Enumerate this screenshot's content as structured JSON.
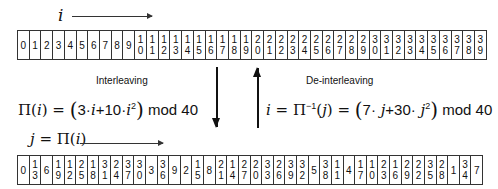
{
  "top": {
    "index_label": "i",
    "cells": [
      "0",
      "1",
      "2",
      "3",
      "4",
      "5",
      "6",
      "7",
      "8",
      "9",
      "10",
      "11",
      "12",
      "13",
      "14",
      "15",
      "16",
      "17",
      "18",
      "19",
      "20",
      "21",
      "22",
      "23",
      "24",
      "25",
      "26",
      "27",
      "28",
      "29",
      "30",
      "31",
      "32",
      "33",
      "34",
      "35",
      "36",
      "37",
      "38",
      "39"
    ]
  },
  "interleaving": {
    "label": "Interleaving",
    "formula_lhs": "Π(",
    "formula_var": "i",
    "formula_rest_open": ") = ",
    "term1_coef": "3·",
    "term1_var": "i",
    "plus": "+10·",
    "term2_var": "i",
    "term2_exp": "2",
    "mod": " mod 40"
  },
  "deinterleaving": {
    "label": "De-interleaving",
    "lhs_var": "i",
    "eq1": " = Π",
    "inv_exp": "−1",
    "open": "(",
    "arg": "j",
    "eq2": ") = ",
    "term1_coef": "7·",
    "term1_var": " j",
    "plus": "+30·",
    "term2_var": " j",
    "term2_exp": "2",
    "mod": " mod 40"
  },
  "bottom": {
    "index_label_var": "j",
    "index_label_eq": " = Π(",
    "index_label_arg": "i",
    "index_label_close": ")",
    "cells": [
      "0",
      "13",
      "6",
      "19",
      "12",
      "25",
      "18",
      "31",
      "24",
      "37",
      "30",
      "3",
      "36",
      "9",
      "2",
      "15",
      "8",
      "21",
      "14",
      "27",
      "20",
      "33",
      "26",
      "39",
      "32",
      "5",
      "38",
      "11",
      "4",
      "17",
      "10",
      "23",
      "16",
      "29",
      "22",
      "35",
      "28",
      "1",
      "34",
      "7"
    ]
  }
}
